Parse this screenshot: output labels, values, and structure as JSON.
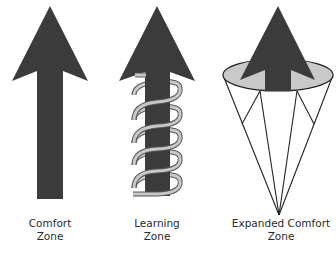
{
  "diagram": {
    "colors": {
      "arrow_fill": "#3b3b3b",
      "spring_fill": "#c8c8c8",
      "spring_stroke": "#555555",
      "disc_fill": "#c9c9c9",
      "cone_stroke": "#222222",
      "text": "#2a2a2a"
    },
    "panels": [
      {
        "id": "comfort",
        "icon": "straight-arrow-icon",
        "label_line1": "Comfort",
        "label_line2": "Zone"
      },
      {
        "id": "learning",
        "icon": "arrow-with-spring-icon",
        "label_line1": "Learning",
        "label_line2": "Zone"
      },
      {
        "id": "expanded",
        "icon": "arrow-with-cone-icon",
        "label_line1": "Expanded Comfort",
        "label_line2": "Zone"
      }
    ]
  }
}
